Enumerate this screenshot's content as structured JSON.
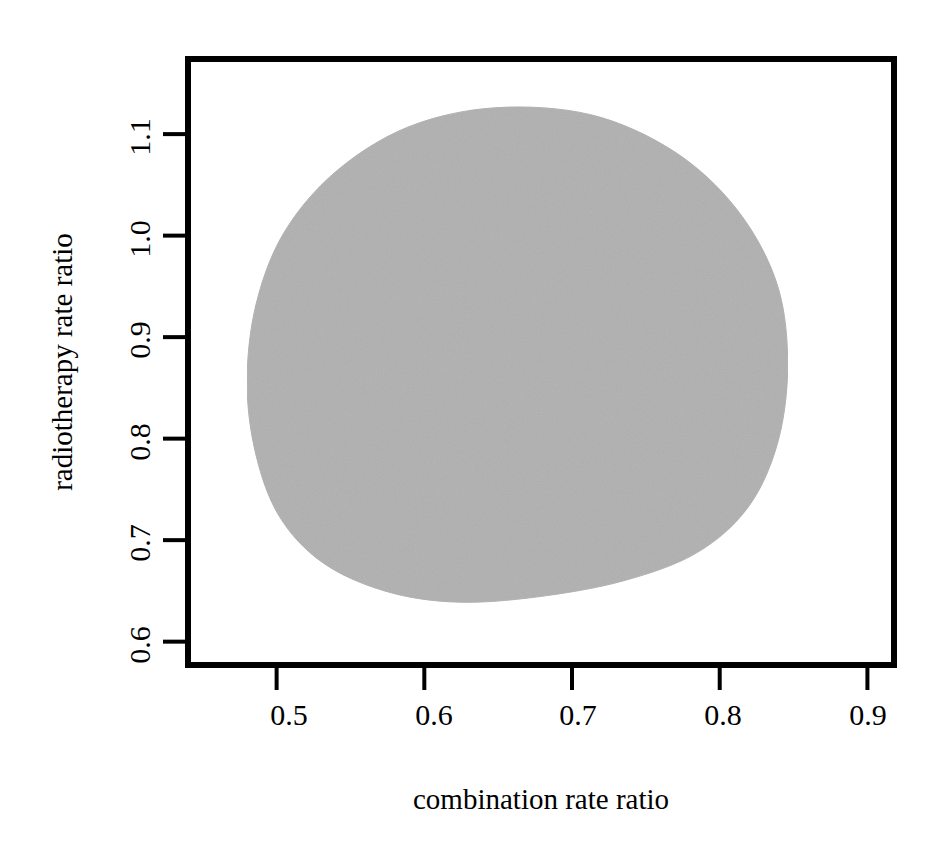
{
  "chart_data": {
    "type": "area",
    "title": "",
    "subtitle": "",
    "xlabel": "combination rate ratio",
    "ylabel": "radiotherapy rate ratio",
    "xlim": [
      0.44,
      0.918
    ],
    "ylim": [
      0.577,
      1.174
    ],
    "grid": false,
    "legend": null,
    "xticks": [
      0.5,
      0.6,
      0.7,
      0.8,
      0.9
    ],
    "xticklabels": [
      "0.5",
      "0.6",
      "0.7",
      "0.8",
      "0.9"
    ],
    "yticks": [
      0.6,
      0.7,
      0.8,
      0.9,
      1.0,
      1.1
    ],
    "yticklabels": [
      "0.6",
      "0.7",
      "0.8",
      "0.9",
      "1.0",
      "1.1"
    ],
    "series": [
      {
        "name": "joint confidence region",
        "fill_color": "#b0b0b0",
        "edge_color": "#b0b0b0",
        "type": "filled-region",
        "description": "shaded egg-shaped joint confidence region for the two rate ratios",
        "x_range": [
          0.48,
          0.846
        ],
        "y_range": [
          0.639,
          1.126
        ],
        "boundary_points": [
          [
            0.648,
            1.126
          ],
          [
            0.713,
            1.119
          ],
          [
            0.769,
            1.083
          ],
          [
            0.811,
            1.027
          ],
          [
            0.838,
            0.956
          ],
          [
            0.846,
            0.879
          ],
          [
            0.84,
            0.8
          ],
          [
            0.82,
            0.734
          ],
          [
            0.785,
            0.688
          ],
          [
            0.735,
            0.66
          ],
          [
            0.676,
            0.644
          ],
          [
            0.621,
            0.639
          ],
          [
            0.573,
            0.65
          ],
          [
            0.531,
            0.678
          ],
          [
            0.502,
            0.723
          ],
          [
            0.486,
            0.784
          ],
          [
            0.48,
            0.855
          ],
          [
            0.486,
            0.932
          ],
          [
            0.505,
            1.003
          ],
          [
            0.54,
            1.063
          ],
          [
            0.589,
            1.107
          ],
          [
            0.648,
            1.126
          ]
        ]
      }
    ]
  },
  "axes": {
    "x_title": "combination rate ratio",
    "y_title": "radiotherapy rate ratio",
    "x_tick_labels": [
      "0.5",
      "0.6",
      "0.7",
      "0.8",
      "0.9"
    ],
    "y_tick_labels": [
      "0.6",
      "0.7",
      "0.8",
      "0.9",
      "1.0",
      "1.1"
    ],
    "frame_color": "#000000",
    "region_color": "#b0b0b0"
  }
}
